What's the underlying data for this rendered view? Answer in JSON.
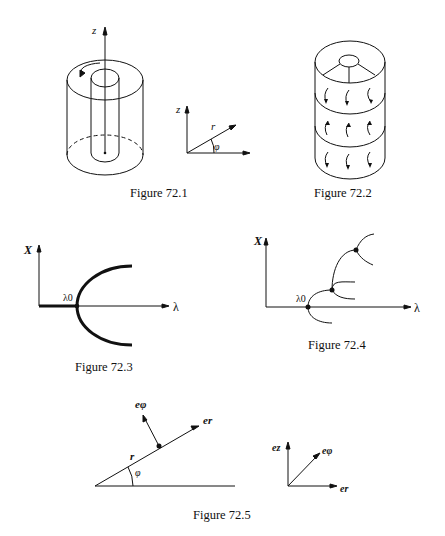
{
  "figures": [
    {
      "id": "72.1",
      "caption": "Figure 72.1",
      "description": "Coaxial cylinders with rotating inner cylinder along z axis, plus cylindrical coordinate frame",
      "labels": {
        "z_axis": "z",
        "frame_z": "z",
        "frame_r": "r",
        "frame_angle": "φ"
      }
    },
    {
      "id": "72.2",
      "caption": "Figure 72.2",
      "description": "Cylinder divided into three stacked Taylor vortex cells with circulation arrows"
    },
    {
      "id": "72.3",
      "caption": "Figure 72.3",
      "description": "Pitchfork bifurcation diagram",
      "labels": {
        "y_axis": "X",
        "x_axis": "λ",
        "critical": "λ0"
      }
    },
    {
      "id": "72.4",
      "caption": "Figure 72.4",
      "description": "Cascade of bifurcations diagram",
      "labels": {
        "y_axis": "X",
        "x_axis": "λ",
        "critical": "λ0"
      }
    },
    {
      "id": "72.5",
      "caption": "Figure 72.5",
      "description": "Polar unit vectors and orthogonal basis",
      "labels": {
        "e_phi": "eφ",
        "e_r": "er",
        "r": "r",
        "angle": "φ",
        "basis_z": "ez",
        "basis_phi": "eφ",
        "basis_r": "er"
      }
    }
  ]
}
